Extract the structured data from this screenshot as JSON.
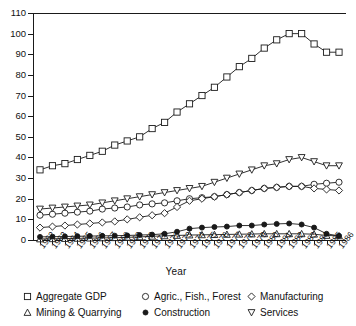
{
  "chart_data": {
    "type": "line",
    "title": "",
    "xlabel": "Year",
    "ylabel": "",
    "xlim": [
      1962,
      1986
    ],
    "ylim": [
      0,
      110
    ],
    "ytick_step": 10,
    "grid": false,
    "legend_position": "bottom",
    "x": [
      1962,
      1963,
      1964,
      1965,
      1966,
      1967,
      1968,
      1969,
      1970,
      1971,
      1972,
      1973,
      1974,
      1975,
      1976,
      1977,
      1978,
      1979,
      1980,
      1981,
      1982,
      1983,
      1984,
      1985,
      1986
    ],
    "categories": [
      "1962",
      "1963",
      "1964",
      "1965",
      "1966",
      "1967",
      "1968",
      "1969",
      "1970",
      "1971",
      "1972",
      "1973",
      "1974",
      "1975",
      "1976",
      "1977",
      "1978",
      "1979",
      "1980",
      "1981",
      "1982",
      "1983",
      "1984",
      "1985",
      "1986"
    ],
    "yticks": [
      0,
      10,
      20,
      30,
      40,
      50,
      60,
      70,
      80,
      90,
      100,
      110
    ],
    "series": [
      {
        "name": "Aggregate GDP",
        "marker": "open-square",
        "filled": false,
        "color": "#1a1a1a",
        "values": [
          34,
          36,
          37,
          39,
          41,
          43,
          46,
          48,
          50,
          54,
          57,
          62,
          66,
          70,
          74,
          79,
          84,
          88,
          93,
          97,
          100,
          100,
          95,
          91,
          91
        ]
      },
      {
        "name": "Agric., Fish., Forest",
        "marker": "open-circle",
        "filled": false,
        "color": "#1a1a1a",
        "values": [
          12,
          12.5,
          13,
          13.5,
          14,
          15,
          15.5,
          16,
          17,
          17.5,
          18,
          19,
          20,
          20.5,
          21,
          22,
          23,
          24,
          25,
          25.5,
          26,
          26,
          27,
          27.5,
          28
        ]
      },
      {
        "name": "Manufacturing",
        "marker": "open-diamond",
        "filled": false,
        "color": "#1a1a1a",
        "values": [
          6,
          6.5,
          7,
          7.5,
          8,
          8.5,
          9,
          10,
          11,
          12,
          13,
          16,
          19,
          20,
          21,
          22,
          23,
          24,
          25,
          25.5,
          26,
          26,
          25,
          24.5,
          24
        ]
      },
      {
        "name": "Mining & Quarrying",
        "marker": "open-triangle-up",
        "filled": false,
        "color": "#1a1a1a",
        "values": [
          0.5,
          0.6,
          0.7,
          0.8,
          0.9,
          1,
          1.1,
          1.3,
          1.5,
          1.8,
          2,
          2.2,
          2.4,
          2.5,
          2.6,
          2.7,
          2.8,
          2.9,
          3,
          3,
          3,
          3,
          2.8,
          2.2,
          2
        ]
      },
      {
        "name": "Construction",
        "marker": "filled-circle",
        "filled": true,
        "color": "#1a1a1a",
        "values": [
          1.5,
          1.6,
          1.7,
          1.8,
          1.9,
          2,
          2.1,
          2.2,
          2.4,
          2.6,
          3,
          4,
          5.5,
          6,
          6.3,
          6.5,
          7,
          7,
          7.5,
          7.8,
          8,
          7.5,
          6,
          3,
          2
        ]
      },
      {
        "name": "Services",
        "marker": "open-triangle-down",
        "filled": false,
        "color": "#1a1a1a",
        "values": [
          15,
          15.5,
          16,
          16.5,
          17,
          18,
          19,
          20,
          21,
          22,
          23,
          24,
          25,
          26,
          28,
          30,
          32,
          34,
          36,
          37,
          39,
          40,
          38,
          36,
          36
        ]
      }
    ]
  },
  "legend": {
    "rows": [
      [
        {
          "marker": "open-square",
          "label": "Aggregate GDP"
        },
        {
          "marker": "open-circle",
          "label": "Agric., Fish., Forest"
        },
        {
          "marker": "open-diamond",
          "label": "Manufacturing"
        }
      ],
      [
        {
          "marker": "open-triangle-up",
          "label": "Mining & Quarrying"
        },
        {
          "marker": "filled-circle",
          "label": "Construction"
        },
        {
          "marker": "open-triangle-down",
          "label": "Services"
        }
      ]
    ]
  },
  "colors": {
    "ink": "#1a1a1a",
    "background": "#ffffff"
  }
}
